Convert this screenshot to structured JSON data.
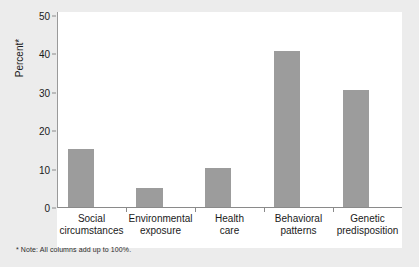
{
  "chart_data": {
    "type": "bar",
    "title": "",
    "subtitle": "",
    "xlabel": "",
    "ylabel": "Percent*",
    "ylim": [
      0,
      50
    ],
    "yticks": [
      0,
      10,
      20,
      30,
      40,
      50
    ],
    "grid": false,
    "legend": null,
    "bar_color": "#9c9c9c",
    "categories": [
      "Social circumstances",
      "Environmental exposure",
      "Health care",
      "Behavioral patterns",
      "Genetic predisposition"
    ],
    "category_lines": [
      [
        "Social",
        "circumstances"
      ],
      [
        "Environmental",
        "exposure"
      ],
      [
        "Health",
        "care"
      ],
      [
        "Behavioral",
        "patterns"
      ],
      [
        "Genetic",
        "predisposition"
      ]
    ],
    "values": [
      15,
      5,
      10,
      40,
      30
    ],
    "annotations": [
      "* Note: All columns add up to 100%."
    ]
  },
  "footnote": "* Note: All columns add up to 100%."
}
